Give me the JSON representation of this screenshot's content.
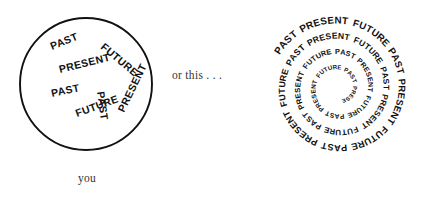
{
  "page": {
    "background_color": "#ffffff",
    "ink_color": "#111111",
    "width": 423,
    "height": 198
  },
  "captions": {
    "middle": "or this . . .",
    "bottom": "you"
  },
  "words": {
    "past": "PAST",
    "present": "PRESENT",
    "future": "FUTURE"
  },
  "left_figure": {
    "name": "circle-of-time-words",
    "shape": "circle",
    "center_x": 86,
    "center_y": 84,
    "radius": 66,
    "stroke_width": 1.9,
    "labels": [
      {
        "text": "PAST",
        "x": 52,
        "y": 50,
        "rotation": -22,
        "size": 10.5
      },
      {
        "text": "FUTURE",
        "x": 100,
        "y": 48,
        "rotation": 40,
        "size": 10.5
      },
      {
        "text": "PRESENT",
        "x": 60,
        "y": 73,
        "rotation": -14,
        "size": 10.5
      },
      {
        "text": "PAST",
        "x": 97,
        "y": 92,
        "rotation": 82,
        "size": 10.5
      },
      {
        "text": "PAST",
        "x": 52,
        "y": 97,
        "rotation": -12,
        "size": 10.5
      },
      {
        "text": "FUTURE",
        "x": 77,
        "y": 117,
        "rotation": -20,
        "size": 10.5
      },
      {
        "text": "PRESENT",
        "x": 124,
        "y": 113,
        "rotation": -64,
        "size": 10.5
      }
    ]
  },
  "right_figure": {
    "name": "spiral-of-time-words",
    "shape": "spiral",
    "center_x": 338,
    "center_y": 88,
    "outer_radius": 67,
    "inner_radius": 12,
    "turns": 3.6,
    "letter_size_outer": 10,
    "letter_size_inner": 5.5,
    "sequence": [
      "PAST",
      "PRESENT",
      "FUTURE"
    ],
    "repeat_text": "PAST PRESENT FUTURE PAST PRESENT FUTURE PAST PRESENT FUTURE PAST PRESENT FUTURE PAST PRESENT FUTURE PAST PRESENT FUTURE PAST PRESENT FUTURE PAST PRESENT FUTURE"
  }
}
